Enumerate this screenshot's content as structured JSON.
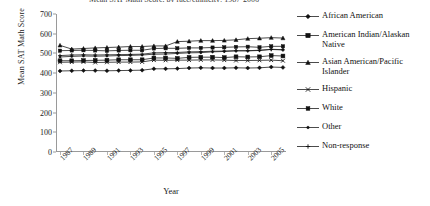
{
  "chart_data": {
    "type": "line",
    "title": "Mean SAT Math Score, by race/ethnicity: 1987-2006",
    "xlabel": "Year",
    "ylabel": "Mean SAT Math Score",
    "ylim": [
      0,
      700
    ],
    "ytick_values": [
      0,
      100,
      200,
      300,
      400,
      500,
      600,
      700
    ],
    "grid": false,
    "legend_position": "right",
    "x": [
      1987,
      1988,
      1989,
      1990,
      1991,
      1992,
      1993,
      1994,
      1995,
      1996,
      1997,
      1998,
      1999,
      2000,
      2001,
      2002,
      2003,
      2004,
      2005,
      2006
    ],
    "xtick_labels": [
      "1987",
      "1989",
      "1991",
      "1993",
      "1995",
      "1997",
      "1999",
      "2001",
      "2003",
      "2005"
    ],
    "series": [
      {
        "name": "African American",
        "marker": "diamond",
        "values": [
          411,
          412,
          413,
          413,
          412,
          413,
          414,
          415,
          422,
          422,
          423,
          426,
          427,
          426,
          426,
          427,
          426,
          427,
          431,
          429
        ]
      },
      {
        "name": "American Indian/Alaskan Native",
        "marker": "square",
        "values": [
          463,
          463,
          464,
          465,
          466,
          468,
          468,
          468,
          477,
          477,
          475,
          480,
          481,
          481,
          479,
          483,
          482,
          483,
          489,
          487
        ]
      },
      {
        "name": "Asian American/Pacific Islander",
        "marker": "triangle",
        "values": [
          541,
          522,
          525,
          528,
          530,
          532,
          535,
          535,
          538,
          538,
          560,
          562,
          565,
          565,
          566,
          569,
          575,
          577,
          580,
          578
        ]
      },
      {
        "name": "Hispanic",
        "marker": "x",
        "values": [
          455,
          456,
          457,
          454,
          455,
          456,
          456,
          457,
          466,
          465,
          466,
          466,
          467,
          467,
          466,
          464,
          464,
          465,
          466,
          463
        ]
      },
      {
        "name": "White",
        "marker": "square-small",
        "values": [
          514,
          515,
          516,
          515,
          513,
          515,
          516,
          516,
          525,
          526,
          526,
          528,
          528,
          530,
          531,
          533,
          534,
          531,
          536,
          536
        ]
      },
      {
        "name": "Other",
        "marker": "dot",
        "values": [
          482,
          485,
          487,
          486,
          487,
          489,
          490,
          492,
          496,
          497,
          500,
          503,
          504,
          508,
          510,
          514,
          513,
          515,
          521,
          519
        ]
      },
      {
        "name": "Non-response",
        "marker": "plus",
        "values": [
          489,
          492,
          493,
          492,
          493,
          494,
          495,
          496,
          503,
          504,
          505,
          508,
          509,
          511,
          512,
          513,
          514,
          516,
          520,
          518
        ]
      }
    ]
  }
}
